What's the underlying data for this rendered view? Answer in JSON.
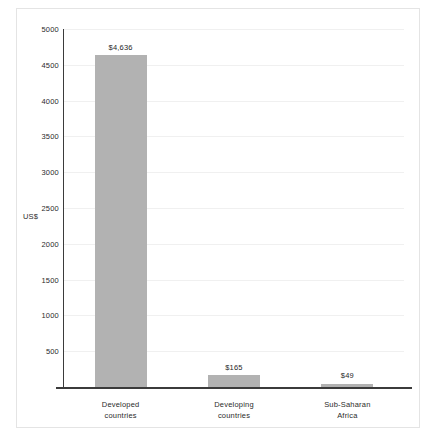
{
  "chart_data": {
    "type": "bar",
    "title": "",
    "subtitle": "",
    "xlabel": "",
    "ylabel": "US$",
    "ylim": [
      0,
      5000
    ],
    "ytick_step": 500,
    "grid": true,
    "legend": null,
    "orientation": "vertical",
    "bar_color": "#b2b2b2",
    "categories": [
      "Developed countries",
      "Developing countries",
      "Sub-Saharan Africa"
    ],
    "category_lines": [
      [
        "Developed",
        "countries"
      ],
      [
        "Developing",
        "countries"
      ],
      [
        "Sub-Saharan",
        "Africa"
      ]
    ],
    "values": [
      4636,
      165,
      49
    ],
    "value_labels": [
      "$4,636",
      "$165",
      "$49"
    ],
    "yticks": [
      {
        "value": 5000,
        "label": "5000"
      },
      {
        "value": 4500,
        "label": "4500"
      },
      {
        "value": 4000,
        "label": "4000"
      },
      {
        "value": 3500,
        "label": "3500"
      },
      {
        "value": 3000,
        "label": "3000"
      },
      {
        "value": 2500,
        "label": "2500"
      },
      {
        "value": 2000,
        "label": "2000"
      },
      {
        "value": 1500,
        "label": "1500"
      },
      {
        "value": 1000,
        "label": "1000"
      },
      {
        "value": 500,
        "label": "500"
      }
    ]
  },
  "colors": {
    "bar": "#b2b2b2",
    "axis": "#3b3b3b",
    "grid": "#f0f0f0",
    "border": "#e4e4e4",
    "text": "#2b2b2b"
  }
}
